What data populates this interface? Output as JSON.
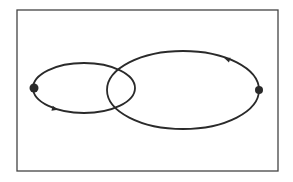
{
  "diagram": {
    "title": "",
    "background": "#ffffff",
    "stroke_color": "#2a2a2a",
    "frame": {
      "x": 17,
      "y": 10,
      "width": 261,
      "height": 161
    },
    "orbits": [
      {
        "id": "small-orbit",
        "cx": 84,
        "cy": 88,
        "rx": 51,
        "ry": 25,
        "direction": "counterclockwise"
      },
      {
        "id": "large-orbit",
        "cx": 183,
        "cy": 90,
        "rx": 76,
        "ry": 39,
        "direction": "counterclockwise"
      }
    ],
    "points": [
      {
        "id": "left-point",
        "x": 34,
        "y": 88,
        "r": 4.5
      },
      {
        "id": "right-point",
        "x": 259,
        "y": 90,
        "r": 4
      }
    ],
    "arrows": [
      {
        "id": "small-orbit-arrow",
        "x": 55,
        "y": 109,
        "angle": 15
      },
      {
        "id": "large-orbit-arrow",
        "x": 227,
        "y": 59,
        "angle": 200
      }
    ]
  }
}
